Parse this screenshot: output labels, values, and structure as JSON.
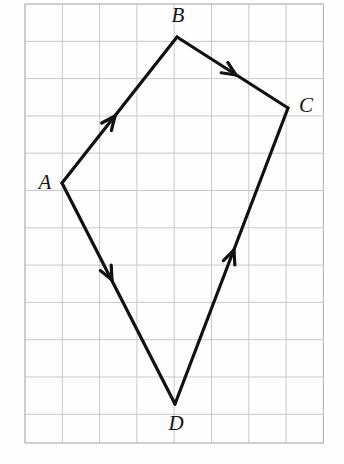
{
  "figure": {
    "name": "quadrilateral-abcd-directed-edges",
    "background_color": "#fefefe",
    "canvas": {
      "width": 344,
      "height": 464
    }
  },
  "grid": {
    "name": "graph-paper-grid",
    "line_color": "#c9c9cd",
    "border_color": "#b8b8bd",
    "line_width": 1,
    "cell_size": 37.3,
    "origin_x": 25,
    "origin_y": 4,
    "columns": 8,
    "rows": 12,
    "x_lines": [
      25,
      62.3,
      99.6,
      136.9,
      174.2,
      211.5,
      248.8,
      286.1,
      323.4
    ],
    "y_lines": [
      4,
      41.3,
      78.6,
      115.9,
      153.2,
      190.5,
      227.8,
      265.1,
      302.4,
      339.7,
      377,
      414.3,
      443
    ]
  },
  "vertices": [
    {
      "id": "A",
      "label": "A",
      "x": 62,
      "y": 183,
      "label_x": 45,
      "label_y": 184,
      "label_position": "left"
    },
    {
      "id": "B",
      "label": "B",
      "x": 177,
      "y": 37,
      "label_x": 178,
      "label_y": 17,
      "label_position": "above"
    },
    {
      "id": "C",
      "label": "C",
      "x": 288,
      "y": 108,
      "label_x": 306,
      "label_y": 107,
      "label_position": "right"
    },
    {
      "id": "D",
      "label": "D",
      "x": 175,
      "y": 404,
      "label_x": 176,
      "label_y": 425,
      "label_position": "below"
    }
  ],
  "edges": [
    {
      "id": "AB",
      "name": "edge-a-to-b",
      "from": "A",
      "to": "B",
      "from_x": 62,
      "from_y": 183,
      "to_x": 177,
      "to_y": 37,
      "stroke": "#111111",
      "stroke_width": 3.2,
      "arrow": {
        "t": 0.46,
        "x": 115,
        "y": 116,
        "direction": "up-right",
        "size": 15
      }
    },
    {
      "id": "BC",
      "name": "edge-b-to-c",
      "from": "B",
      "to": "C",
      "from_x": 177,
      "from_y": 37,
      "to_x": 288,
      "to_y": 108,
      "stroke": "#111111",
      "stroke_width": 3.2,
      "arrow": {
        "t": 0.53,
        "x": 236,
        "y": 75,
        "direction": "down-right",
        "size": 15
      }
    },
    {
      "id": "AD",
      "name": "edge-a-to-d",
      "from": "A",
      "to": "D",
      "from_x": 62,
      "from_y": 183,
      "to_x": 175,
      "to_y": 404,
      "stroke": "#111111",
      "stroke_width": 3.2,
      "arrow": {
        "t": 0.44,
        "x": 112,
        "y": 280,
        "direction": "down-right",
        "size": 15
      }
    },
    {
      "id": "DC",
      "name": "edge-d-to-c",
      "from": "D",
      "to": "C",
      "from_x": 175,
      "from_y": 404,
      "to_x": 288,
      "to_y": 108,
      "stroke": "#111111",
      "stroke_width": 3.2,
      "arrow": {
        "t": 0.52,
        "x": 234,
        "y": 250,
        "direction": "up-right",
        "size": 15
      }
    }
  ],
  "chart_data": {
    "type": "scatter",
    "title": "",
    "xlabel": "",
    "ylabel": "",
    "grid": true,
    "legend": "none",
    "points": [
      {
        "label": "A",
        "x": 62,
        "y": 183
      },
      {
        "label": "B",
        "x": 177,
        "y": 37
      },
      {
        "label": "C",
        "x": 288,
        "y": 108
      },
      {
        "label": "D",
        "x": 175,
        "y": 404
      }
    ],
    "segments": [
      {
        "name": "AB",
        "from": "A",
        "to": "B",
        "directed": true
      },
      {
        "name": "BC",
        "from": "B",
        "to": "C",
        "directed": true
      },
      {
        "name": "AD",
        "from": "A",
        "to": "D",
        "directed": true
      },
      {
        "name": "DC",
        "from": "D",
        "to": "C",
        "directed": true
      }
    ],
    "xlim": [
      0,
      344
    ],
    "ylim": [
      0,
      464
    ]
  }
}
